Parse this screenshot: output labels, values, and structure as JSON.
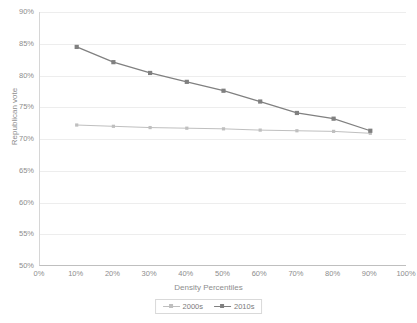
{
  "chart_data": {
    "type": "line",
    "title": "",
    "xlabel": "Density Percentiles",
    "ylabel": "Republican vote",
    "xlim": [
      0,
      100
    ],
    "ylim": [
      50,
      90
    ],
    "grid": true,
    "legend_position": "bottom",
    "x": [
      10,
      20,
      30,
      40,
      50,
      60,
      70,
      80,
      90
    ],
    "xticklabels": [
      "0%",
      "10%",
      "20%",
      "30%",
      "40%",
      "50%",
      "60%",
      "70%",
      "80%",
      "90%",
      "100%"
    ],
    "xtickvalues": [
      0,
      10,
      20,
      30,
      40,
      50,
      60,
      70,
      80,
      90,
      100
    ],
    "yticklabels": [
      "50%",
      "55%",
      "60%",
      "65%",
      "70%",
      "75%",
      "80%",
      "85%",
      "90%"
    ],
    "ytickvalues": [
      50,
      55,
      60,
      65,
      70,
      75,
      80,
      85,
      90
    ],
    "series": [
      {
        "name": "2000s",
        "color": "#bfbfbf",
        "marker": "square",
        "values": [
          72.2,
          72.0,
          71.8,
          71.7,
          71.6,
          71.4,
          71.3,
          71.2,
          70.9
        ]
      },
      {
        "name": "2010s",
        "color": "#808080",
        "marker": "square",
        "values": [
          84.5,
          82.1,
          80.4,
          79.0,
          77.6,
          75.9,
          74.1,
          73.2,
          71.3
        ]
      }
    ]
  },
  "legend": {
    "entries": [
      {
        "label": "2000s"
      },
      {
        "label": "2010s"
      }
    ]
  },
  "colors": {
    "series_2000s": "#bfbfbf",
    "series_2010s": "#808080",
    "gridline": "#ededed",
    "axis": "#bfbfbf",
    "text": "#8d8d8d",
    "background": "#ffffff"
  }
}
